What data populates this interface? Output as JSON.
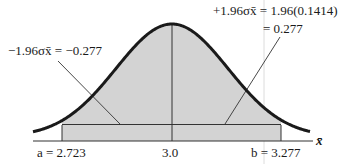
{
  "figure": {
    "type": "normal-distribution-confidence-interval",
    "axis_label": "x̄",
    "center_label": "3.0",
    "left_bound_label": "a = 2.723",
    "right_bound_label": "b = 3.277",
    "left_annotation": "−1.96σx̄ = −0.277",
    "right_annotation_line1": "+1.96σx̄ = 1.96(0.1414)",
    "right_annotation_line2": "= 0.277",
    "colors": {
      "curve": "#1a1a1a",
      "shade": "#d3d3d3",
      "line": "#333333",
      "guide": "#d8d8d8"
    }
  },
  "chart_data": {
    "type": "area",
    "title": "",
    "xlabel": "x̄",
    "ylabel": "",
    "distribution": "normal",
    "mean": 3.0,
    "std_error": 0.1414,
    "z": 1.96,
    "margin": 0.277,
    "interval": [
      2.723,
      3.277
    ],
    "shaded_region": [
      2.723,
      3.277
    ],
    "tick_labels": [
      "a = 2.723",
      "3.0",
      "b = 3.277"
    ],
    "annotations": [
      "−1.96σx̄ = −0.277",
      "+1.96σx̄ = 1.96(0.1414) = 0.277"
    ]
  }
}
